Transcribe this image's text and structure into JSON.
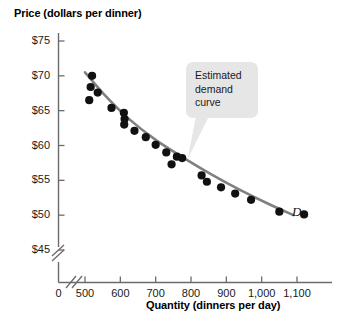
{
  "chart_data": {
    "type": "scatter",
    "title": "",
    "xlabel": "Quantity (dinners per day)",
    "ylabel": "Price (dollars per dinner)",
    "xlim": [
      450,
      1160
    ],
    "ylim": [
      43,
      77
    ],
    "grid": false,
    "legend": "none",
    "axis_break_x": true,
    "axis_break_y": true,
    "x_origin_label": "0",
    "xticks": [
      500,
      600,
      700,
      800,
      900,
      1000,
      1100
    ],
    "xtick_labels": [
      "500",
      "600",
      "700",
      "800",
      "900",
      "1,000",
      "1,100"
    ],
    "yticks": [
      45,
      50,
      55,
      60,
      65,
      70,
      75
    ],
    "ytick_labels": [
      "$45",
      "$50",
      "$55",
      "$60",
      "$65",
      "$70",
      "$75"
    ],
    "series": [
      {
        "name": "Observed price-quantity pairs",
        "type": "scatter",
        "marker": "filled-circle",
        "color": "#111111",
        "points": [
          {
            "x": 520,
            "y": 70.0
          },
          {
            "x": 516,
            "y": 68.4
          },
          {
            "x": 536,
            "y": 67.6
          },
          {
            "x": 512,
            "y": 66.5
          },
          {
            "x": 575,
            "y": 65.4
          },
          {
            "x": 610,
            "y": 64.7
          },
          {
            "x": 612,
            "y": 63.8
          },
          {
            "x": 611,
            "y": 63.0
          },
          {
            "x": 640,
            "y": 62.1
          },
          {
            "x": 672,
            "y": 61.2
          },
          {
            "x": 700,
            "y": 60.1
          },
          {
            "x": 730,
            "y": 59.0
          },
          {
            "x": 760,
            "y": 58.4
          },
          {
            "x": 745,
            "y": 57.3
          },
          {
            "x": 775,
            "y": 58.2
          },
          {
            "x": 830,
            "y": 55.7
          },
          {
            "x": 845,
            "y": 54.8
          },
          {
            "x": 885,
            "y": 54.0
          },
          {
            "x": 925,
            "y": 53.1
          },
          {
            "x": 970,
            "y": 52.2
          },
          {
            "x": 1050,
            "y": 50.5
          },
          {
            "x": 1120,
            "y": 50.1
          }
        ]
      },
      {
        "name": "Estimated demand curve",
        "type": "line",
        "color": "#808080",
        "label": "D",
        "points": [
          {
            "x": 500,
            "y": 70.5
          },
          {
            "x": 560,
            "y": 67.0
          },
          {
            "x": 620,
            "y": 64.0
          },
          {
            "x": 700,
            "y": 60.8
          },
          {
            "x": 780,
            "y": 58.2
          },
          {
            "x": 860,
            "y": 55.8
          },
          {
            "x": 940,
            "y": 53.6
          },
          {
            "x": 1020,
            "y": 51.6
          },
          {
            "x": 1090,
            "y": 50.0
          }
        ]
      }
    ],
    "annotations": [
      {
        "name": "estimated-demand-curve-callout",
        "lines": [
          "Estimated",
          "demand",
          "curve"
        ],
        "points_to": {
          "x": 790,
          "y": 58.0
        }
      },
      {
        "name": "demand-curve-label",
        "text": "D"
      }
    ]
  },
  "axes": {
    "y_title": "Price (dollars per dinner)",
    "x_title": "Quantity (dinners per day)",
    "origin": "0"
  },
  "callout": {
    "line1": "Estimated",
    "line2": "demand",
    "line3": "curve"
  },
  "curve_label": {
    "text": "D"
  },
  "colors": {
    "point": "#111111",
    "curve": "#808080",
    "axis": "#6b6b6b",
    "callout_bg": "#e6e6e6",
    "text": "#1a1a1a"
  }
}
